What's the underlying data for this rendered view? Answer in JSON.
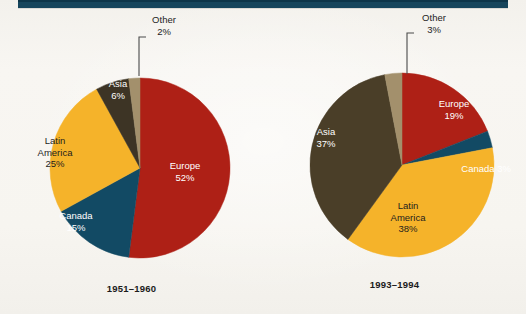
{
  "page": {
    "background_color": "#f7f5f1",
    "rule_color": "#16455c"
  },
  "palette": {
    "europe": "#ae2016",
    "canada": "#124a64",
    "latin_america": "#f5b32a",
    "asia_left": "#3d3425",
    "asia_right": "#4a3e28",
    "other": "#a3906c"
  },
  "charts": {
    "left": {
      "caption": "1951–1960",
      "labels": {
        "europe": "Europe\n52%",
        "canada": "Canada\n15%",
        "latin_america": "Latin\nAmerica\n25%",
        "asia": "Asia\n6%",
        "other": "Other\n2%"
      }
    },
    "right": {
      "caption": "1993–1994",
      "labels": {
        "europe": "Europe\n19%",
        "canada": "Canada 3%",
        "latin_america": "Latin\nAmerica\n38%",
        "asia": "Asia\n37%",
        "other": "Other\n3%"
      }
    }
  },
  "chart_data": [
    {
      "type": "pie",
      "title": "1951–1960",
      "categories": [
        "Europe",
        "Canada",
        "Latin America",
        "Asia",
        "Other"
      ],
      "values": [
        52,
        15,
        25,
        6,
        2
      ],
      "unit": "percent",
      "colors": [
        "#ae2016",
        "#124a64",
        "#f5b32a",
        "#3d3425",
        "#a3906c"
      ],
      "start_angle_deg": 0,
      "direction": "clockwise",
      "legend": "none",
      "data_labels": true,
      "center_px": [
        140,
        168
      ],
      "radius_px": 90
    },
    {
      "type": "pie",
      "title": "1993–1994",
      "categories": [
        "Europe",
        "Canada",
        "Latin America",
        "Asia",
        "Other"
      ],
      "values": [
        19,
        3,
        38,
        37,
        3
      ],
      "unit": "percent",
      "colors": [
        "#ae2016",
        "#124a64",
        "#f5b32a",
        "#4a3e28",
        "#a3906c"
      ],
      "start_angle_deg": 0,
      "direction": "clockwise",
      "legend": "none",
      "data_labels": true,
      "center_px": [
        402,
        165
      ],
      "radius_px": 92
    }
  ]
}
